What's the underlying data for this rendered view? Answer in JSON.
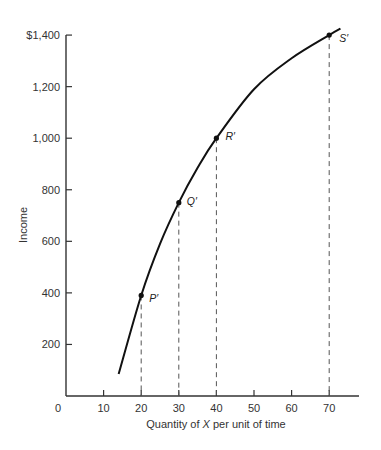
{
  "chart_data": {
    "type": "line",
    "title": "",
    "xlabel": "Quantity of X per unit of time",
    "xlabel_parts": {
      "pre": "Quantity of ",
      "italic": "X",
      "post": " per unit of time"
    },
    "ylabel": "Income",
    "xlim": [
      0,
      75
    ],
    "ylim": [
      0,
      1400
    ],
    "x_ticks": [
      10,
      20,
      30,
      40,
      50,
      60,
      70
    ],
    "x_tick_labels": [
      "0",
      "10",
      "20",
      "30",
      "40",
      "50",
      "60",
      "70"
    ],
    "y_ticks": [
      200,
      400,
      600,
      800,
      1000,
      1200,
      1400
    ],
    "y_tick_labels": [
      "200",
      "400",
      "600",
      "800",
      "1,000",
      "1,200",
      "$1,400"
    ],
    "grid": false,
    "legend": null,
    "curve": {
      "name": "Income-consumption curve",
      "x": [
        14,
        20,
        25,
        30,
        35,
        40,
        50,
        60,
        70,
        73
      ],
      "y": [
        85,
        390,
        590,
        750,
        885,
        1000,
        1190,
        1310,
        1400,
        1425
      ]
    },
    "points": [
      {
        "label": "P′",
        "x": 20,
        "y": 390
      },
      {
        "label": "Q′",
        "x": 30,
        "y": 750
      },
      {
        "label": "R′",
        "x": 40,
        "y": 1000
      },
      {
        "label": "S′",
        "x": 70,
        "y": 1400
      }
    ],
    "annotations": "Dashed vertical drop lines from each labeled point to the x-axis"
  },
  "axes": {
    "y_title": "Income",
    "x_title_pre": "Quantity of ",
    "x_title_italic": "X",
    "x_title_post": " per unit of time",
    "origin_label": "0"
  },
  "colors": {
    "line": "#111111",
    "axis": "#333333",
    "dash": "#555555"
  }
}
